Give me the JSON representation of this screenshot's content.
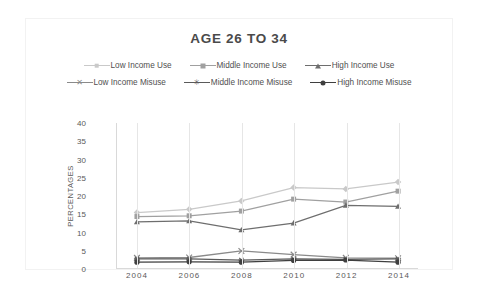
{
  "chart_data": {
    "type": "line",
    "title": "AGE 26 TO 34",
    "xlabel": "",
    "ylabel": "PERCENTAGES",
    "x": [
      2004,
      2006,
      2008,
      2010,
      2012,
      2014
    ],
    "categories": [
      "2004",
      "2006",
      "2008",
      "2010",
      "2012",
      "2014"
    ],
    "ylim": [
      0,
      40
    ],
    "yticks": [
      0,
      5,
      10,
      15,
      20,
      25,
      30,
      35,
      40
    ],
    "ytick_labels": [
      "0",
      "5",
      "10",
      "15",
      "20",
      "25",
      "30",
      "35",
      "40"
    ],
    "grid": "vertical",
    "legend_position": "top",
    "series": [
      {
        "name": "Low Income Use",
        "marker": "diamond",
        "color": "#c9c9c9",
        "values": [
          15.3,
          16.2,
          18.5,
          22.2,
          21.8,
          23.7
        ]
      },
      {
        "name": "Middle Income Use",
        "marker": "square",
        "color": "#a0a0a0",
        "values": [
          14.2,
          14.4,
          15.7,
          19.0,
          18.2,
          21.2
        ]
      },
      {
        "name": "High Income Use",
        "marker": "triangle",
        "color": "#6e6e6e",
        "values": [
          12.7,
          13.0,
          10.5,
          12.4,
          17.3,
          17.0
        ]
      },
      {
        "name": "Low Income Misuse",
        "marker": "x",
        "color": "#8a8a8a",
        "values": [
          2.8,
          2.9,
          4.7,
          3.7,
          2.8,
          2.7
        ]
      },
      {
        "name": "Middle Income Misuse",
        "marker": "star",
        "color": "#5a5a5a",
        "values": [
          2.5,
          2.5,
          2.2,
          2.5,
          2.4,
          2.5
        ]
      },
      {
        "name": "High Income Misuse",
        "marker": "circle",
        "color": "#3f3f3f",
        "values": [
          1.6,
          1.7,
          1.6,
          2.1,
          2.2,
          1.6
        ]
      }
    ]
  },
  "legend": {
    "rows": [
      [
        "Low Income Use",
        "Middle Income Use",
        "High Income Use"
      ],
      [
        "Low Income Misuse",
        "Middle Income Misuse",
        "High Income Misuse"
      ]
    ]
  },
  "colors": {
    "title": "#4a4a4a",
    "axis": "#d9d9d9",
    "grid": "#e6e6e6",
    "tick_text": "#595959",
    "frame_border": "#f2f2f2",
    "background": "#ffffff"
  }
}
